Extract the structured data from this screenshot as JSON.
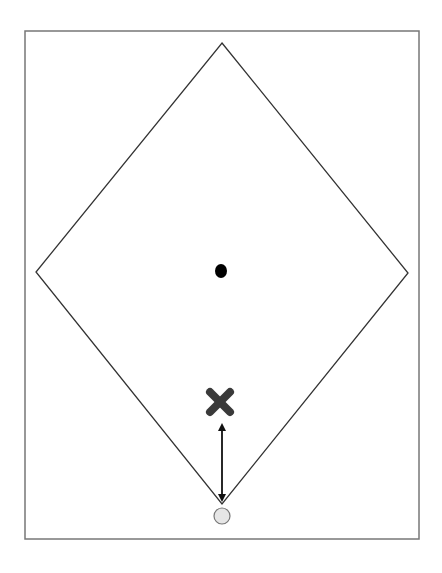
{
  "diagram": {
    "colors": {
      "background": "#ffffff",
      "frame_stroke": "#777777",
      "diamond_stroke": "#333333",
      "center_dot": "#000000",
      "x_marker": "#3a3a3a",
      "arrow": "#111111",
      "start_circle_fill": "#e6e6e6",
      "start_circle_stroke": "#777777"
    },
    "frame": {
      "x": 25,
      "y": 31,
      "width": 394,
      "height": 508
    },
    "diamond": {
      "top": [
        222,
        43
      ],
      "right": [
        408,
        273
      ],
      "bottom": [
        222,
        504
      ],
      "left": [
        36,
        272
      ]
    },
    "center_dot": {
      "cx": 221,
      "cy": 271,
      "rx": 6,
      "ry": 7
    },
    "x_marker": {
      "cx": 220,
      "cy": 402,
      "size": 26
    },
    "arrow": {
      "x": 222,
      "y1": 423,
      "y2": 502,
      "bidirectional": true
    },
    "start_circle": {
      "cx": 222,
      "cy": 516,
      "r": 8
    }
  }
}
